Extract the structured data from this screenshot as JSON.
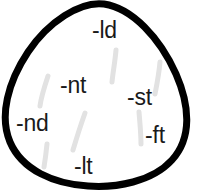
{
  "diagram": {
    "name": "consonant-cluster-teardrop",
    "shape": "teardrop",
    "outline_color": "#000000",
    "outline_width": 7,
    "fill_color": "#ffffff",
    "tick_color": "#e2e2e2",
    "labels": [
      {
        "text": "-ld",
        "position": "top"
      },
      {
        "text": "-nt",
        "position": "upper-left-center"
      },
      {
        "text": "-st",
        "position": "right-center"
      },
      {
        "text": "-nd",
        "position": "left"
      },
      {
        "text": "-ft",
        "position": "lower-right"
      },
      {
        "text": "-lt",
        "position": "bottom"
      }
    ],
    "tick_marks": 6
  }
}
